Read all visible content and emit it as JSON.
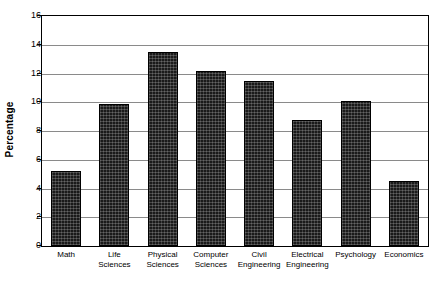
{
  "chart_data": {
    "type": "bar",
    "title": "",
    "xlabel": "",
    "ylabel": "Percentage",
    "ylim": [
      0,
      16
    ],
    "ytick_step": 2,
    "yticks": [
      16,
      14,
      12,
      10,
      8,
      6,
      4,
      2,
      0
    ],
    "grid": true,
    "legend": "none",
    "bar_color": "#1a1a1a",
    "bar_fill_pattern": "dense-crosshatch",
    "axis_color": "#000000",
    "gridline_color": "#8a8a8a",
    "categories": [
      "Math",
      "Life Sciences",
      "Physical Sciences",
      "Computer Sciences",
      "Civil Engineering",
      "Electrical Engineering",
      "Psychology",
      "Economics"
    ],
    "category_lines": [
      [
        "Math"
      ],
      [
        "Life",
        "Sciences"
      ],
      [
        "Physical",
        "Sciences"
      ],
      [
        "Computer",
        "Sciences"
      ],
      [
        "Civil",
        "Engineering"
      ],
      [
        "Electrical",
        "Engineering"
      ],
      [
        "Psychology"
      ],
      [
        "Economics"
      ]
    ],
    "values": [
      5.2,
      9.9,
      13.5,
      12.2,
      11.5,
      8.8,
      10.1,
      4.5
    ]
  }
}
